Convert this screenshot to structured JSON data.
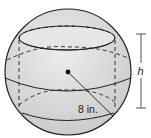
{
  "diagram": {
    "type": "sphere-with-inscribed-cylinder",
    "radius_label": "8 in.",
    "height_label": "h",
    "colors": {
      "sphere_fill": "#d9d9d9",
      "stroke": "#231f20",
      "dim_line": "#555555"
    }
  }
}
